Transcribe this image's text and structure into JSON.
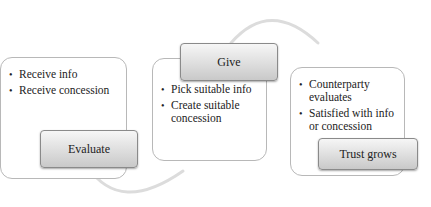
{
  "diagram": {
    "type": "cycle-process",
    "steps": [
      {
        "header": "Evaluate",
        "bullets": [
          "Receive info",
          "Receive concession"
        ]
      },
      {
        "header": "Give",
        "bullets": [
          "Pick suitable info",
          "Create suitable concession"
        ]
      },
      {
        "header": "Trust grows",
        "bullets": [
          "Counterparty evaluates",
          "Satisfied with info or concession"
        ]
      }
    ],
    "connectors": [
      {
        "from": "Evaluate",
        "to": "Give",
        "shape": "arc-below"
      },
      {
        "from": "Give",
        "to": "Trust grows",
        "shape": "arc-above"
      }
    ],
    "colors": {
      "box_border": "#b8b8b8",
      "header_gradient_top": "#f6f6f6",
      "header_gradient_bottom": "#c9c9c9",
      "arc": "#d9d9d9"
    }
  }
}
